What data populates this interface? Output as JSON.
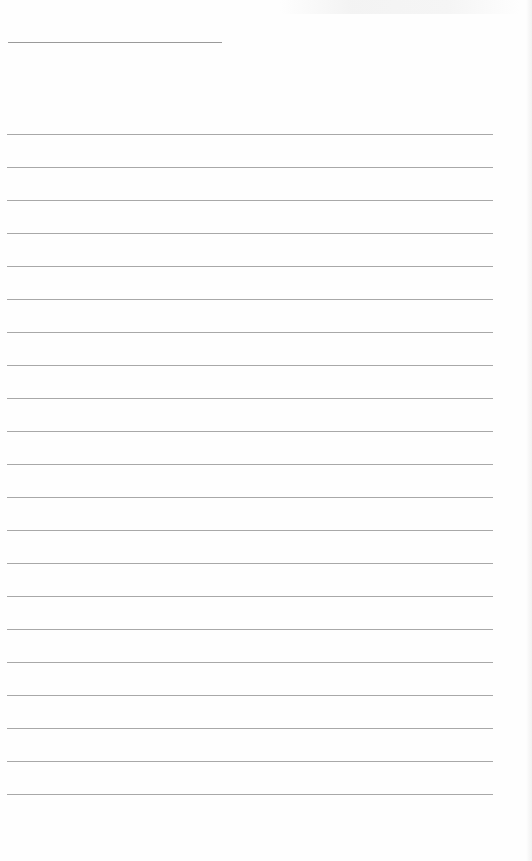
{
  "document": {
    "type": "blank lined sheet",
    "header_line": {
      "present": true
    },
    "ruled_lines": {
      "count": 21,
      "first_y": 134,
      "spacing": 33
    },
    "colors": {
      "paper": "#fefefe",
      "line": "#a8a8a8"
    }
  }
}
